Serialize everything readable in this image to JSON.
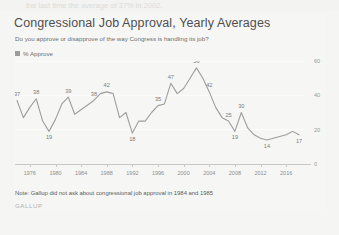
{
  "top_strip_text": "the last time the average of 37% in 2002.",
  "card": {
    "title": "Congressional Job Approval, Yearly Averages",
    "subtitle": "Do you approve or disapprove of the way Congress is handling its job?",
    "legend_label": "% Approve",
    "note": "Note: Gallup did not ask about congressional job approval in 1984 and 1985",
    "brand": "GALLUP"
  },
  "colors": {
    "line": "#9e9e9e",
    "legend_swatch": "#9c9c9c",
    "grid": "#fdfdfd",
    "card_bg": "#f6f6f5",
    "page_bg": "#f5f5f4",
    "title_text": "#4f4f4f",
    "axis_text": "#8d8d8d"
  },
  "chart_data": {
    "type": "line",
    "title": "Congressional Job Approval, Yearly Averages",
    "subtitle": "Do you approve or disapprove of the way Congress is handling its job?",
    "xlabel": "",
    "ylabel": "",
    "ylim": [
      0,
      60
    ],
    "yticks": [
      0,
      20,
      40,
      60
    ],
    "xticks": [
      1976,
      1980,
      1984,
      1988,
      1992,
      1996,
      2000,
      2004,
      2008,
      2012,
      2016
    ],
    "xlim": [
      1974,
      2018
    ],
    "grid": true,
    "legend": [
      "% Approve"
    ],
    "legend_position": "top-left",
    "series": [
      {
        "name": "% Approve",
        "x": [
          1974,
          1975,
          1976,
          1977,
          1978,
          1979,
          1980,
          1981,
          1982,
          1983,
          1986,
          1987,
          1988,
          1989,
          1990,
          1991,
          1992,
          1993,
          1994,
          1995,
          1996,
          1997,
          1998,
          1999,
          2000,
          2001,
          2002,
          2003,
          2004,
          2005,
          2006,
          2007,
          2008,
          2009,
          2010,
          2011,
          2012,
          2013,
          2014,
          2015,
          2016,
          2017,
          2018
        ],
        "values": [
          37,
          27,
          33,
          38,
          25,
          19,
          26,
          35,
          39,
          29,
          37,
          41,
          42,
          41,
          27,
          30,
          18,
          25,
          25,
          30,
          34,
          35,
          47,
          41,
          44,
          50,
          56,
          50,
          42,
          33,
          27,
          25,
          19,
          30,
          21,
          17,
          15,
          14,
          15,
          16,
          17,
          19,
          17
        ]
      }
    ],
    "point_labels": [
      {
        "x": 1974,
        "value": 37
      },
      {
        "x": 1977,
        "value": 38
      },
      {
        "x": 1979,
        "value": 19
      },
      {
        "x": 1982,
        "value": 39
      },
      {
        "x": 1988,
        "value": 42
      },
      {
        "x": 1986,
        "value": 38
      },
      {
        "x": 1992,
        "value": 18
      },
      {
        "x": 1996,
        "value": 35
      },
      {
        "x": 1998,
        "value": 47
      },
      {
        "x": 2002,
        "value": 56
      },
      {
        "x": 2004,
        "value": 42
      },
      {
        "x": 2007,
        "value": 25
      },
      {
        "x": 2008,
        "value": 19
      },
      {
        "x": 2009,
        "value": 30
      },
      {
        "x": 2013,
        "value": 14
      },
      {
        "x": 2018,
        "value": 17
      }
    ]
  }
}
